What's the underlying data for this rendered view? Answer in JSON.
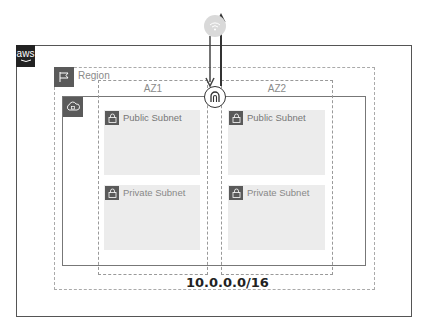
{
  "diagram": {
    "cloud": {
      "logo_text": "aws"
    },
    "region": {
      "label": "Region"
    },
    "vpc": {
      "cidr": "10.0.0.0/16"
    },
    "azs": [
      {
        "label": "AZ1",
        "subnets": [
          {
            "label": "Public Subnet"
          },
          {
            "label": "Private Subnet"
          }
        ]
      },
      {
        "label": "AZ2",
        "subnets": [
          {
            "label": "Public Subnet"
          },
          {
            "label": "Private Subnet"
          }
        ]
      }
    ],
    "icons": {
      "internet": "wifi-icon",
      "igw": "internet-gateway-icon",
      "region": "flag-icon",
      "vpc": "cloud-lock-icon",
      "subnet": "lock-icon"
    },
    "colors": {
      "internet_circle": "#d9d9d9",
      "icon_bg": "#5a5a5a",
      "subnet_bg": "#ececec",
      "arrow": "#444444"
    }
  }
}
